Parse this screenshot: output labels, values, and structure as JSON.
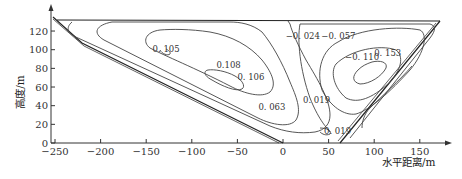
{
  "chart_data": {
    "type": "contour",
    "title": "",
    "xlabel": "水平距离/m",
    "ylabel": "高度/m",
    "xlim": [
      -260,
      175
    ],
    "ylim": [
      0,
      135
    ],
    "xticks": [
      -250,
      -200,
      -150,
      -100,
      -50,
      0,
      50,
      100,
      150
    ],
    "xtick_labels": [
      "−250",
      "−200",
      "−150",
      "−100",
      "−50",
      "0",
      "50",
      "100",
      "150"
    ],
    "yticks": [
      0,
      20,
      40,
      60,
      80,
      100,
      120
    ],
    "ytick_labels": [
      "0",
      "20",
      "40",
      "60",
      "80",
      "100",
      "120"
    ],
    "grid": false,
    "boundary": {
      "name": "basin-outline",
      "points": [
        [
          -255,
          130
        ],
        [
          -200,
          102
        ],
        [
          0,
          0
        ],
        [
          60,
          0
        ],
        [
          165,
          130
        ]
      ]
    },
    "contour_labels": [
      {
        "text": "0. 105",
        "x": -143,
        "y": 98
      },
      {
        "text": "0.108",
        "x": -73,
        "y": 80
      },
      {
        "text": "0. 106",
        "x": -50,
        "y": 68
      },
      {
        "text": "0. 063",
        "x": -27,
        "y": 35
      },
      {
        "text": "0. 019",
        "x": 22,
        "y": 43
      },
      {
        "text": "0. 019",
        "x": 45,
        "y": 10
      },
      {
        "text": "−0. 024",
        "x": 3,
        "y": 112
      },
      {
        "text": "−0. 057",
        "x": 42,
        "y": 112
      },
      {
        "text": "−0. 110",
        "x": 68,
        "y": 89
      },
      {
        "text": "0. 153",
        "x": 100,
        "y": 93
      }
    ],
    "contour_levels": [
      0.019,
      0.063,
      0.105,
      0.106,
      0.108,
      -0.024,
      -0.057,
      -0.11,
      -0.153
    ]
  }
}
